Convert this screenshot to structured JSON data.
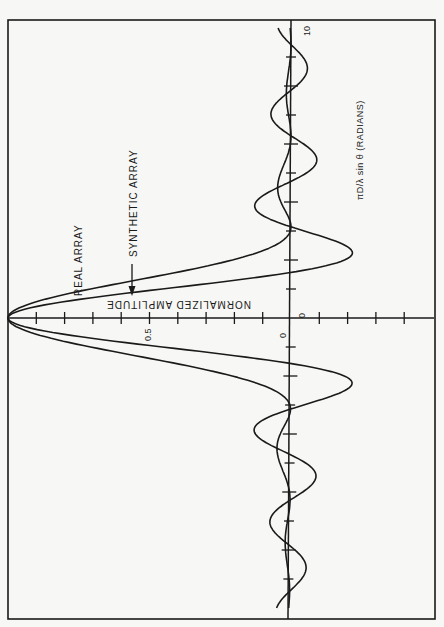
{
  "chart_data": {
    "type": "line",
    "orientation": "rotated 90deg: amplitude axis horizontal (1.0 at left, negative values to right), angle axis vertical",
    "title": "",
    "xlabel": "πD/λ sin θ (RADIANS)",
    "ylabel": "NORMALIZED AMPLITUDE",
    "x_range": [
      -10,
      10
    ],
    "y_range": [
      -0.4,
      1.0
    ],
    "x_ticks_step": 1,
    "y_ticks_step": 0.1,
    "tick_labels": {
      "x": [
        "0",
        "10"
      ],
      "y": [
        "0",
        "0.5"
      ]
    },
    "grid": false,
    "legend": [
      {
        "name": "REAL ARRAY",
        "annotation": "label"
      },
      {
        "name": "SYNTHETIC ARRAY",
        "annotation": "label with arrow"
      }
    ],
    "x": [
      -10,
      -9.5,
      -9,
      -8.5,
      -8,
      -7.5,
      -7,
      -6.5,
      -6,
      -5.5,
      -5,
      -4.5,
      -4,
      -3.5,
      -3,
      -2.75,
      -2.5,
      -2.25,
      -2,
      -1.75,
      -1.5,
      -1.25,
      -1,
      -0.75,
      -0.5,
      -0.25,
      0,
      0.25,
      0.5,
      0.75,
      1,
      1.25,
      1.5,
      1.75,
      2,
      2.25,
      2.5,
      2.75,
      3,
      3.5,
      4,
      4.5,
      5,
      5.5,
      6,
      6.5,
      7,
      7.5,
      8,
      8.5,
      9,
      9.5,
      10
    ],
    "series": [
      {
        "name": "REAL ARRAY",
        "values": [
          0.003,
          0.0,
          0.002,
          0.009,
          0.01,
          0.016,
          0.009,
          0.001,
          0.002,
          0.016,
          0.037,
          0.047,
          0.036,
          0.01,
          0.002,
          0.018,
          0.057,
          0.121,
          0.207,
          0.311,
          0.442,
          0.582,
          0.708,
          0.823,
          0.919,
          0.979,
          1.0,
          0.979,
          0.919,
          0.823,
          0.708,
          0.582,
          0.442,
          0.311,
          0.207,
          0.121,
          0.057,
          0.018,
          0.002,
          0.01,
          0.036,
          0.047,
          0.037,
          0.016,
          0.002,
          0.001,
          0.009,
          0.016,
          0.01,
          0.009,
          0.002,
          0.0,
          0.003
        ]
      },
      {
        "name": "SYNTHETIC ARRAY",
        "values": [
          0.046,
          -0.048,
          -0.042,
          -0.056,
          -0.036,
          0.087,
          0.07,
          0.064,
          -0.045,
          -0.091,
          -0.054,
          0.091,
          0.124,
          0.094,
          -0.047,
          -0.129,
          -0.192,
          -0.217,
          -0.189,
          -0.1,
          0.047,
          0.239,
          0.455,
          0.665,
          0.841,
          0.959,
          1.0,
          0.959,
          0.841,
          0.665,
          0.455,
          0.239,
          0.047,
          -0.1,
          -0.189,
          -0.217,
          -0.192,
          -0.129,
          -0.047,
          0.094,
          0.124,
          0.091,
          -0.054,
          -0.091,
          -0.045,
          0.064,
          0.07,
          0.087,
          -0.036,
          -0.056,
          -0.042,
          -0.048,
          0.046
        ]
      }
    ]
  },
  "labels": {
    "x_axis": "πD/λ sin θ (RADIANS)",
    "y_axis": "NORMALIZED AMPLITUDE",
    "real": "REAL ARRAY",
    "synthetic": "SYNTHETIC ARRAY",
    "tick_half": "0.5",
    "tick_zero_amp": "0",
    "tick_zero_angle": "0",
    "tick_ten": "10"
  },
  "style": {
    "ink": "#1a1a1a",
    "paper": "#f7f7f5"
  }
}
